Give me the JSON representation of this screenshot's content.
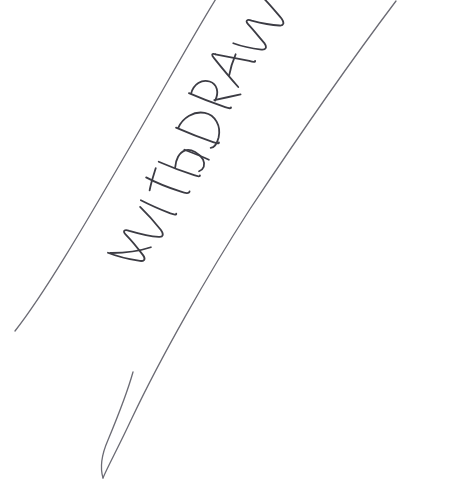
{
  "page": {
    "kind": "scanned-document-fragment",
    "width": 476,
    "height": 490,
    "background_color": "#ffffff",
    "alt_text": "Scanned paper with the word WITHDRAWN handwritten diagonally between two thin curved pen lines"
  },
  "annotation": {
    "word": "WITHDRAWN",
    "letters": [
      "W",
      "I",
      "T",
      "H",
      "D",
      "R",
      "A",
      "W",
      "N"
    ],
    "script_style": "handwritten block capitals",
    "rotation_degrees": -57,
    "ink_color": "#3c3c44",
    "stroke_width_px": 1.8,
    "center_x": 185,
    "center_y": 180
  },
  "marks": {
    "ink_color": "#55555e",
    "hairline_color": "#6b6b74",
    "curve_stroke_width_px": 1.3,
    "items": [
      {
        "name": "left-boundary-curve",
        "description": "thin pen curve sweeping from top edge down to lower left, ending in a taper",
        "start": [
          218,
          0
        ],
        "end": [
          15,
          330
        ]
      },
      {
        "name": "right-boundary-curve",
        "description": "thin pen curve from upper right sweeping down and left to a narrow point",
        "start": [
          395,
          2
        ],
        "end": [
          103,
          478
        ]
      },
      {
        "name": "lower-taper-loop",
        "description": "narrow elongated loop closing the band at the bottom",
        "start": [
          103,
          478
        ],
        "end": [
          133,
          372
        ]
      }
    ]
  }
}
